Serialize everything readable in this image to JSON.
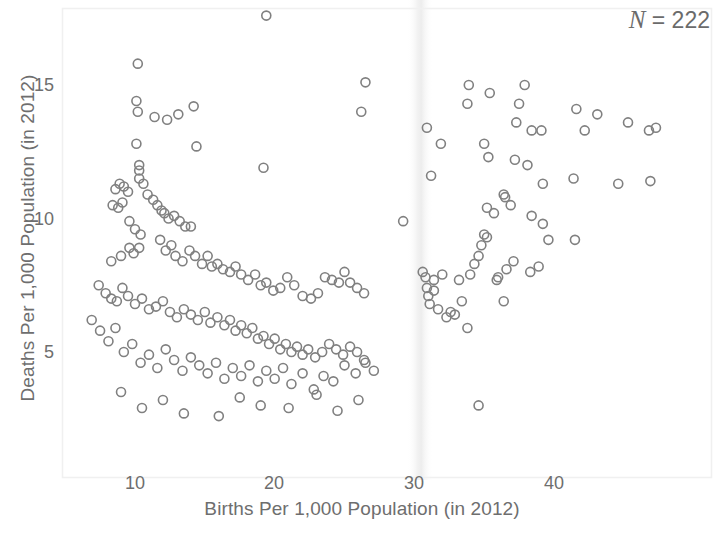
{
  "annotation": {
    "n_symbol": "N",
    "n_text": " = 222"
  },
  "axes": {
    "x_title": "Births Per 1,000 Population (in 2012)",
    "y_title": "Deaths Per 1,000 Population (in 2012)",
    "x_ticks": [
      "10",
      "20",
      "30",
      "40"
    ],
    "y_ticks": [
      "15",
      "10",
      "5"
    ]
  },
  "chart_data": {
    "type": "scatter",
    "title": "",
    "xlabel": "Births Per 1,000 Population (in 2012)",
    "ylabel": "Deaths Per 1,000 Population (in 2012)",
    "xlim": [
      5.8,
      48.8
    ],
    "ylim": [
      1.6,
      18.2
    ],
    "xticks": [
      10,
      20,
      30,
      40
    ],
    "yticks": [
      5,
      10,
      15
    ],
    "grid": false,
    "legend": null,
    "n_points": 222,
    "marker": {
      "shape": "circle-open",
      "color": "#808080",
      "size": 9,
      "stroke_width": 1.6
    },
    "points": [
      [
        19.4,
        17.6
      ],
      [
        10.2,
        15.8
      ],
      [
        33.9,
        15.0
      ],
      [
        37.9,
        15.0
      ],
      [
        26.5,
        15.1
      ],
      [
        35.4,
        14.7
      ],
      [
        10.1,
        14.4
      ],
      [
        10.2,
        14.0
      ],
      [
        11.4,
        13.8
      ],
      [
        12.3,
        13.7
      ],
      [
        13.1,
        13.9
      ],
      [
        14.2,
        14.2
      ],
      [
        26.2,
        14.0
      ],
      [
        33.8,
        14.3
      ],
      [
        37.5,
        14.3
      ],
      [
        41.6,
        14.1
      ],
      [
        45.3,
        13.6
      ],
      [
        47.3,
        13.4
      ],
      [
        10.1,
        12.8
      ],
      [
        14.4,
        12.7
      ],
      [
        30.9,
        13.4
      ],
      [
        31.9,
        12.8
      ],
      [
        35.0,
        12.8
      ],
      [
        37.3,
        13.6
      ],
      [
        38.4,
        13.3
      ],
      [
        39.1,
        13.3
      ],
      [
        42.2,
        13.3
      ],
      [
        43.1,
        13.9
      ],
      [
        46.8,
        13.3
      ],
      [
        10.3,
        12.0
      ],
      [
        10.3,
        11.8
      ],
      [
        10.3,
        11.5
      ],
      [
        19.2,
        11.9
      ],
      [
        31.2,
        11.6
      ],
      [
        35.3,
        12.3
      ],
      [
        37.2,
        12.2
      ],
      [
        38.1,
        12.0
      ],
      [
        39.2,
        11.3
      ],
      [
        41.4,
        11.5
      ],
      [
        44.6,
        11.3
      ],
      [
        46.9,
        11.4
      ],
      [
        8.6,
        11.1
      ],
      [
        8.9,
        11.3
      ],
      [
        9.2,
        11.2
      ],
      [
        9.5,
        11.0
      ],
      [
        10.6,
        11.3
      ],
      [
        10.9,
        10.9
      ],
      [
        11.3,
        10.7
      ],
      [
        8.4,
        10.5
      ],
      [
        8.8,
        10.4
      ],
      [
        9.1,
        10.6
      ],
      [
        11.6,
        10.5
      ],
      [
        11.9,
        10.3
      ],
      [
        12.1,
        10.2
      ],
      [
        12.4,
        10.0
      ],
      [
        12.8,
        10.1
      ],
      [
        13.2,
        9.9
      ],
      [
        13.6,
        9.7
      ],
      [
        14.0,
        9.7
      ],
      [
        9.6,
        9.9
      ],
      [
        10.0,
        9.6
      ],
      [
        10.4,
        9.4
      ],
      [
        29.2,
        9.9
      ],
      [
        35.2,
        10.4
      ],
      [
        35.7,
        10.2
      ],
      [
        36.4,
        10.9
      ],
      [
        36.9,
        10.5
      ],
      [
        38.4,
        10.1
      ],
      [
        39.2,
        9.8
      ],
      [
        8.3,
        8.4
      ],
      [
        9.0,
        8.6
      ],
      [
        9.6,
        8.9
      ],
      [
        9.9,
        8.7
      ],
      [
        10.3,
        8.9
      ],
      [
        11.8,
        9.2
      ],
      [
        12.2,
        8.8
      ],
      [
        12.6,
        9.0
      ],
      [
        12.9,
        8.6
      ],
      [
        13.4,
        8.4
      ],
      [
        13.9,
        8.8
      ],
      [
        14.3,
        8.6
      ],
      [
        14.8,
        8.3
      ],
      [
        15.2,
        8.6
      ],
      [
        15.5,
        8.2
      ],
      [
        15.9,
        8.3
      ],
      [
        16.3,
        8.1
      ],
      [
        16.8,
        8.0
      ],
      [
        17.2,
        8.2
      ],
      [
        17.6,
        7.9
      ],
      [
        18.1,
        7.7
      ],
      [
        18.6,
        7.9
      ],
      [
        19.0,
        7.5
      ],
      [
        19.4,
        7.6
      ],
      [
        19.9,
        7.3
      ],
      [
        20.4,
        7.4
      ],
      [
        20.9,
        7.8
      ],
      [
        21.4,
        7.5
      ],
      [
        22.0,
        7.1
      ],
      [
        22.6,
        7.0
      ],
      [
        23.1,
        7.2
      ],
      [
        23.6,
        7.8
      ],
      [
        24.1,
        7.7
      ],
      [
        24.6,
        7.6
      ],
      [
        25.0,
        8.0
      ],
      [
        25.4,
        7.6
      ],
      [
        25.9,
        7.4
      ],
      [
        26.4,
        7.2
      ],
      [
        7.4,
        7.5
      ],
      [
        7.9,
        7.2
      ],
      [
        8.3,
        7.0
      ],
      [
        8.7,
        6.9
      ],
      [
        9.1,
        7.4
      ],
      [
        9.5,
        7.1
      ],
      [
        10.0,
        6.8
      ],
      [
        10.5,
        7.0
      ],
      [
        11.0,
        6.6
      ],
      [
        11.5,
        6.7
      ],
      [
        12.0,
        6.9
      ],
      [
        12.5,
        6.5
      ],
      [
        13.0,
        6.3
      ],
      [
        13.5,
        6.6
      ],
      [
        14.0,
        6.4
      ],
      [
        14.5,
        6.2
      ],
      [
        15.0,
        6.5
      ],
      [
        15.4,
        6.1
      ],
      [
        15.9,
        6.3
      ],
      [
        16.4,
        6.0
      ],
      [
        16.8,
        6.2
      ],
      [
        17.2,
        5.8
      ],
      [
        17.6,
        6.0
      ],
      [
        18.0,
        5.7
      ],
      [
        18.4,
        5.9
      ],
      [
        18.8,
        5.5
      ],
      [
        19.2,
        5.6
      ],
      [
        19.6,
        5.3
      ],
      [
        20.0,
        5.5
      ],
      [
        20.4,
        5.1
      ],
      [
        20.8,
        5.3
      ],
      [
        21.2,
        5.0
      ],
      [
        21.6,
        5.2
      ],
      [
        22.0,
        4.9
      ],
      [
        22.4,
        5.1
      ],
      [
        22.9,
        4.8
      ],
      [
        23.4,
        5.0
      ],
      [
        23.9,
        5.3
      ],
      [
        24.4,
        5.1
      ],
      [
        24.9,
        4.9
      ],
      [
        25.4,
        5.2
      ],
      [
        25.9,
        5.0
      ],
      [
        26.4,
        4.7
      ],
      [
        6.9,
        6.2
      ],
      [
        7.5,
        5.8
      ],
      [
        8.1,
        5.4
      ],
      [
        8.6,
        5.9
      ],
      [
        9.2,
        5.0
      ],
      [
        9.8,
        5.3
      ],
      [
        10.4,
        4.6
      ],
      [
        11.0,
        4.9
      ],
      [
        11.6,
        4.4
      ],
      [
        12.2,
        5.1
      ],
      [
        12.8,
        4.7
      ],
      [
        13.4,
        4.3
      ],
      [
        14.0,
        4.8
      ],
      [
        14.6,
        4.5
      ],
      [
        15.2,
        4.2
      ],
      [
        15.8,
        4.6
      ],
      [
        16.4,
        4.0
      ],
      [
        17.0,
        4.4
      ],
      [
        17.6,
        4.1
      ],
      [
        18.2,
        4.5
      ],
      [
        18.8,
        3.9
      ],
      [
        19.4,
        4.3
      ],
      [
        20.0,
        4.0
      ],
      [
        20.6,
        4.4
      ],
      [
        21.2,
        3.8
      ],
      [
        22.0,
        4.2
      ],
      [
        22.8,
        3.6
      ],
      [
        23.5,
        4.1
      ],
      [
        24.2,
        3.9
      ],
      [
        25.0,
        4.5
      ],
      [
        25.8,
        4.2
      ],
      [
        26.5,
        4.6
      ],
      [
        27.1,
        4.3
      ],
      [
        9.0,
        3.5
      ],
      [
        10.5,
        2.9
      ],
      [
        12.0,
        3.2
      ],
      [
        13.5,
        2.7
      ],
      [
        16.0,
        2.6
      ],
      [
        17.5,
        3.3
      ],
      [
        19.0,
        3.0
      ],
      [
        21.0,
        2.9
      ],
      [
        23.0,
        3.4
      ],
      [
        24.5,
        2.8
      ],
      [
        26.0,
        3.2
      ],
      [
        30.6,
        8.0
      ],
      [
        30.8,
        7.8
      ],
      [
        30.9,
        7.4
      ],
      [
        31.0,
        7.1
      ],
      [
        31.1,
        6.8
      ],
      [
        31.4,
        7.7
      ],
      [
        31.4,
        7.3
      ],
      [
        31.7,
        6.6
      ],
      [
        32.0,
        7.9
      ],
      [
        32.3,
        6.3
      ],
      [
        32.6,
        6.5
      ],
      [
        32.9,
        6.4
      ],
      [
        33.2,
        7.7
      ],
      [
        33.4,
        6.9
      ],
      [
        33.8,
        5.9
      ],
      [
        34.0,
        7.9
      ],
      [
        34.3,
        8.3
      ],
      [
        34.6,
        8.6
      ],
      [
        34.8,
        9.0
      ],
      [
        35.0,
        9.4
      ],
      [
        35.2,
        9.3
      ],
      [
        34.6,
        3.0
      ],
      [
        35.9,
        7.7
      ],
      [
        36.0,
        7.8
      ],
      [
        36.4,
        6.9
      ],
      [
        36.6,
        8.1
      ],
      [
        37.1,
        8.4
      ],
      [
        38.3,
        8.0
      ],
      [
        38.9,
        8.2
      ],
      [
        39.6,
        9.2
      ],
      [
        41.5,
        9.2
      ],
      [
        36.5,
        10.8
      ]
    ]
  }
}
